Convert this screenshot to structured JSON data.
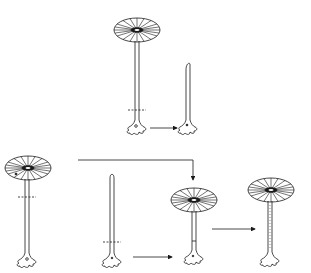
{
  "diagram": {
    "type": "biology-illustration",
    "colors": {
      "line": "#1a1a1a",
      "background": "#ffffff"
    },
    "nodes": [
      {
        "id": "top-parent",
        "kind": "plant-with-cap",
        "cx": 137
      },
      {
        "id": "top-regrowth",
        "kind": "plant-stalk-only",
        "cx": 188
      },
      {
        "id": "bottom-left-parent",
        "kind": "plant-with-cap",
        "cx": 27
      },
      {
        "id": "bottom-middle-stalk",
        "kind": "plant-stalk-only",
        "cx": 112
      },
      {
        "id": "graft-result",
        "kind": "plant-with-cap",
        "cx": 194
      },
      {
        "id": "final-result",
        "kind": "plant-with-cap",
        "cx": 271
      }
    ],
    "edges": [
      {
        "from": "top-parent",
        "to": "top-regrowth"
      },
      {
        "from": "bottom-left-parent",
        "to": "graft-result"
      },
      {
        "from": "bottom-middle-stalk",
        "to": "graft-result"
      },
      {
        "from": "graft-result",
        "to": "final-result"
      }
    ]
  }
}
